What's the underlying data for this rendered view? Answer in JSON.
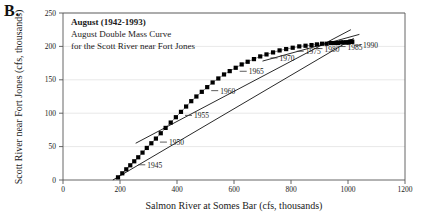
{
  "figure": {
    "panel_letter": "B.",
    "title_lines": [
      "August (1942-1993)",
      "August Double Mass Curve",
      "for the Scott River near Fort Jones"
    ]
  },
  "chart_data": {
    "type": "scatter",
    "title": "August Double Mass Curve for the Scott River near Fort Jones",
    "subtitle": "August (1942-1993)",
    "xlabel": "Salmon River at Somes Bar (cfs, thousands)",
    "ylabel": "Scott River near Fort Jones (cfs, thousands)",
    "xlim": [
      0,
      1200
    ],
    "ylim": [
      0,
      250
    ],
    "xticks": [
      0,
      200,
      400,
      600,
      800,
      1000,
      1200
    ],
    "yticks": [
      0,
      50,
      100,
      150,
      200,
      250
    ],
    "grid": true,
    "legend": "none",
    "marker": "filled-square",
    "series": [
      {
        "name": "Cumulative August flow (1942-1993)",
        "x": [
          193,
          208,
          222,
          236,
          250,
          264,
          279,
          294,
          310,
          326,
          343,
          360,
          378,
          396,
          414,
          432,
          450,
          468,
          487,
          506,
          525,
          545,
          565,
          585,
          606,
          627,
          648,
          670,
          692,
          714,
          737,
          760,
          783,
          806,
          829,
          851,
          872,
          891,
          909,
          925,
          940,
          953,
          965,
          975,
          984,
          992,
          998,
          1003,
          1007,
          1010,
          1013,
          1015
        ],
        "y": [
          4,
          10,
          16,
          22,
          28,
          34,
          41,
          48,
          55,
          62,
          70,
          78,
          86,
          94,
          102,
          110,
          118,
          125,
          132,
          139,
          146,
          152,
          158,
          163,
          168,
          173,
          177,
          181,
          185,
          188,
          191,
          194,
          196,
          198,
          200,
          201,
          202,
          203,
          204,
          204,
          205,
          205,
          205,
          206,
          206,
          206,
          206,
          206,
          207,
          207,
          207,
          207
        ]
      }
    ],
    "annotations": [
      {
        "label": "1945",
        "x": 250,
        "y": 28
      },
      {
        "label": "1950",
        "x": 326,
        "y": 62
      },
      {
        "label": "1955",
        "x": 414,
        "y": 102
      },
      {
        "label": "1960",
        "x": 506,
        "y": 139
      },
      {
        "label": "1965",
        "x": 606,
        "y": 168
      },
      {
        "label": "1970",
        "x": 714,
        "y": 188
      },
      {
        "label": "1975",
        "x": 806,
        "y": 198
      },
      {
        "label": "1980",
        "x": 872,
        "y": 202
      },
      {
        "label": "1985",
        "x": 953,
        "y": 205
      },
      {
        "label": "1990",
        "x": 1007,
        "y": 207
      }
    ],
    "reference_lines": [
      {
        "name": "lower-trend-line",
        "x0": 175,
        "y0": 0,
        "x1": 1020,
        "y1": 212
      },
      {
        "name": "upper-early-line",
        "x0": 255,
        "y0": 55,
        "x1": 1010,
        "y1": 225
      },
      {
        "name": "upper-late-line",
        "x0": 700,
        "y0": 178,
        "x1": 1040,
        "y1": 218
      }
    ]
  }
}
